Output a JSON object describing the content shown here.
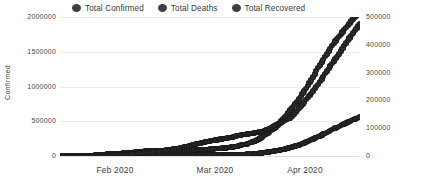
{
  "legend": {
    "position": "top-center",
    "items": [
      {
        "label": "Total Confirmed",
        "marker": "circle-marker-icon",
        "color": "#2e2e31"
      },
      {
        "label": "Total Deaths",
        "marker": "circle-marker-icon",
        "color": "#2e2e31"
      },
      {
        "label": "Total Recovered",
        "marker": "circle-marker-icon",
        "color": "#2e2e31"
      }
    ]
  },
  "axes": {
    "left_title": "Confirmed",
    "right_title": "Deaths / Recovered",
    "left_ticks": [
      "0",
      "500000",
      "1000000",
      "1500000",
      "2000000"
    ],
    "right_ticks": [
      "0",
      "100000",
      "200000",
      "300000",
      "400000",
      "500000"
    ],
    "x_ticks": [
      "Feb 2020",
      "Mar 2020",
      "Apr 2020"
    ]
  },
  "chart_data": {
    "type": "line",
    "title": "",
    "subtitle": "",
    "xlabel": "",
    "ylabel": "Confirmed",
    "y2label": "Deaths / Recovered",
    "grid": true,
    "legend_position": "top-center",
    "xlim": [
      "2020-01-22",
      "2020-04-17"
    ],
    "ylim": [
      0,
      2000000
    ],
    "y2lim": [
      0,
      500000
    ],
    "x_tick_labels": [
      "Feb 2020",
      "Mar 2020",
      "Apr 2020"
    ],
    "y_tick_values": [
      0,
      500000,
      1000000,
      1500000,
      2000000
    ],
    "y2_tick_values": [
      0,
      100000,
      200000,
      300000,
      400000,
      500000
    ],
    "x": [
      "2020-01-22",
      "2020-01-24",
      "2020-01-26",
      "2020-01-28",
      "2020-01-30",
      "2020-02-01",
      "2020-02-03",
      "2020-02-05",
      "2020-02-07",
      "2020-02-09",
      "2020-02-11",
      "2020-02-13",
      "2020-02-15",
      "2020-02-17",
      "2020-02-19",
      "2020-02-21",
      "2020-02-23",
      "2020-02-25",
      "2020-02-27",
      "2020-02-29",
      "2020-03-02",
      "2020-03-04",
      "2020-03-06",
      "2020-03-08",
      "2020-03-10",
      "2020-03-12",
      "2020-03-14",
      "2020-03-16",
      "2020-03-18",
      "2020-03-20",
      "2020-03-22",
      "2020-03-24",
      "2020-03-26",
      "2020-03-28",
      "2020-03-30",
      "2020-04-01",
      "2020-04-03",
      "2020-04-05",
      "2020-04-07",
      "2020-04-09",
      "2020-04-11",
      "2020-04-13",
      "2020-04-15",
      "2020-04-17"
    ],
    "series": [
      {
        "name": "Total Confirmed",
        "axis": "left",
        "color": "#2e2e31",
        "marker": "circle",
        "values": [
          555,
          1950,
          2927,
          5578,
          8234,
          12038,
          19881,
          28276,
          34391,
          40554,
          45178,
          60370,
          69030,
          73332,
          75748,
          77794,
          79205,
          81397,
          84120,
          87021,
          90306,
          95124,
          101800,
          110000,
          120000,
          135000,
          156000,
          182000,
          218000,
          275000,
          345000,
          420000,
          530000,
          660000,
          785000,
          935000,
          1095000,
          1270000,
          1430000,
          1590000,
          1720000,
          1850000,
          1970000,
          2070000
        ]
      },
      {
        "name": "Total Deaths",
        "axis": "right",
        "color": "#2e2e31",
        "marker": "circle",
        "values": [
          17,
          56,
          82,
          131,
          171,
          259,
          426,
          565,
          719,
          910,
          1115,
          1369,
          1665,
          1775,
          2126,
          2247,
          2462,
          2770,
          2872,
          2977,
          3087,
          3254,
          3460,
          3825,
          4296,
          4980,
          5833,
          7126,
          8733,
          11397,
          14652,
          18894,
          24073,
          30105,
          37582,
          47210,
          58787,
          69374,
          81865,
          95718,
          106138,
          118785,
          130885,
          141000
        ]
      },
      {
        "name": "Total Recovered",
        "axis": "right",
        "color": "#2e2e31",
        "marker": "circle",
        "values": [
          28,
          49,
          61,
          107,
          143,
          284,
          623,
          1487,
          2651,
          3996,
          5150,
          7977,
          10865,
          12583,
          16121,
          20631,
          23394,
          27905,
          33354,
          39782,
          45602,
          51171,
          55866,
          60694,
          64404,
          70251,
          75922,
          79433,
          84331,
          88426,
          98334,
          113792,
          124325,
          137270,
          164566,
          194743,
          225796,
          258256,
          296201,
          333021,
          367436,
          406867,
          442500,
          477000
        ]
      }
    ]
  }
}
